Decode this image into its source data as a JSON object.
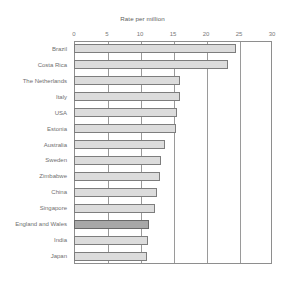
{
  "top_sliver_text": "",
  "chart_data": {
    "type": "bar",
    "orientation": "horizontal",
    "title": "Rate per million",
    "xlabel": "",
    "ylabel": "",
    "xlim": [
      0,
      30
    ],
    "xticks": [
      0,
      5,
      10,
      15,
      20,
      25,
      30
    ],
    "xtick_labels": [
      "0",
      "5",
      "10",
      "15",
      "20",
      "25",
      "30"
    ],
    "grid": true,
    "grid_axis": "x",
    "legend": "none",
    "categories": [
      "Brazil",
      "Costa Rica",
      "The Netherlands",
      "Italy",
      "USA",
      "Estonia",
      "Australia",
      "Sweden",
      "Zimbabwe",
      "China",
      "Singapore",
      "England and Wales",
      "India",
      "Japan"
    ],
    "values": [
      24.5,
      23.4,
      16.1,
      16.0,
      15.6,
      15.5,
      13.8,
      13.2,
      13.0,
      12.6,
      12.3,
      11.4,
      11.2,
      11.1
    ],
    "highlighted_category": "England and Wales",
    "colors": {
      "bar_fill": "#dcdcdc",
      "bar_edge": "#7d7d7d",
      "highlight_fill": "#a8a8a8",
      "highlight_edge": "#6a6a6a",
      "gridline": "#9a9a9a",
      "frame": "#8e8e8e",
      "text": "#6f6f6f"
    }
  }
}
